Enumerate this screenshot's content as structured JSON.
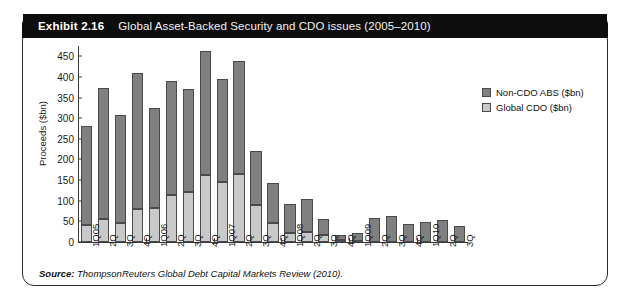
{
  "exhibit": {
    "number": "Exhibit 2.16",
    "title": "Global Asset-Backed Security and CDO issues (2005–2010)",
    "source_label": "Source:",
    "source_text": "ThompsonReuters Global Debt Capital Markets Review (2010)."
  },
  "colors": {
    "non_cdo_abs": "#808080",
    "global_cdo": "#c9c9c9",
    "bar_outline": "#4a4a4a",
    "header_bg": "#0d0d0d",
    "panel_border": "#2b2b2b",
    "text": "#1a1a1a"
  },
  "chart_data": {
    "type": "bar",
    "stacked": true,
    "title": "Global Asset-Backed Security and CDO issues (2005–2010)",
    "xlabel": "",
    "ylabel": "Proceeds ($bn)",
    "ylim": [
      0,
      475
    ],
    "ytick_step": 50,
    "yticks": [
      0,
      50,
      100,
      150,
      200,
      250,
      300,
      350,
      400,
      450
    ],
    "grid": false,
    "legend_position": "right-top",
    "categories": [
      "1Q05",
      "2Q",
      "3Q",
      "4Q",
      "1Q06",
      "2Q",
      "3Q",
      "4Q",
      "1Q07",
      "2Q",
      "3Q",
      "4Q",
      "1Q08",
      "2Q",
      "3Q",
      "4Q",
      "1Q09",
      "2Q",
      "3Q",
      "4Q",
      "1Q10",
      "2Q",
      "3Q"
    ],
    "series": [
      {
        "name": "Global CDO ($bn)",
        "color": "#c9c9c9",
        "values": [
          42,
          55,
          47,
          81,
          82,
          113,
          121,
          162,
          146,
          165,
          89,
          46,
          21,
          24,
          16,
          4,
          3,
          0,
          0,
          0,
          0,
          0,
          0
        ]
      },
      {
        "name": "Non-CDO ABS ($bn)",
        "color": "#808080",
        "values": [
          240,
          318,
          260,
          329,
          244,
          277,
          251,
          301,
          249,
          274,
          131,
          98,
          70,
          81,
          40,
          13,
          20,
          57,
          62,
          44,
          48,
          53,
          38
        ]
      }
    ],
    "totals": [
      282,
      373,
      307,
      410,
      326,
      390,
      372,
      463,
      395,
      439,
      220,
      144,
      91,
      105,
      56,
      17,
      23,
      57,
      62,
      44,
      48,
      53,
      38
    ]
  },
  "legend": {
    "entries": [
      {
        "label": "Non-CDO ABS ($bn)",
        "color": "#808080"
      },
      {
        "label": "Global CDO ($bn)",
        "color": "#c9c9c9"
      }
    ]
  }
}
